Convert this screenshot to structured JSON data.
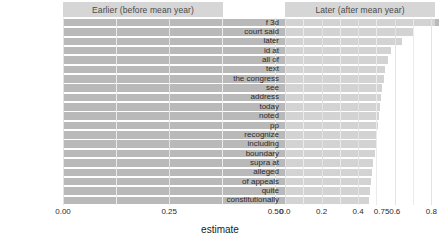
{
  "chart_data": {
    "type": "bar",
    "title": "",
    "xlabel": "estimate",
    "ylabel": "",
    "orientation": "horizontal",
    "grid": true,
    "legend": false,
    "facets": [
      {
        "strip_label": "Earlier (before mean year)",
        "xlim": [
          0.0,
          0.885
        ],
        "xticks": [
          0.0,
          0.25,
          0.5,
          0.75
        ],
        "xticklabels": [
          "0.00",
          "0.25",
          "0.50",
          "0.75"
        ],
        "categories": [
          "1st",
          "ought",
          "admit",
          "case of",
          "afterwards",
          "yet",
          "ch",
          "the said",
          "this cause",
          "section of",
          "laid",
          "occasion",
          "contended",
          "considered as",
          "the counsel",
          "on board",
          "the judges",
          "the defendant",
          "supposed",
          "thing"
        ],
        "values": [
          0.885,
          0.845,
          0.815,
          0.8,
          0.79,
          0.787,
          0.785,
          0.783,
          0.78,
          0.77,
          0.718,
          0.668,
          0.663,
          0.65,
          0.63,
          0.62,
          0.615,
          0.61,
          0.605,
          0.6
        ]
      },
      {
        "strip_label": "Later (after mean year)",
        "xlim": [
          0.0,
          0.82
        ],
        "xticks": [
          0.0,
          0.2,
          0.4,
          0.6,
          0.8
        ],
        "xticklabels": [
          "0.0",
          "0.2",
          "0.4",
          "0.6",
          "0.8"
        ],
        "categories": [
          "f 3d",
          "court said",
          "later",
          "id at",
          "all of",
          "text",
          "the congress",
          "see",
          "address",
          "today",
          "noted",
          "pp",
          "recognize",
          "including",
          "boundary",
          "supra at",
          "alleged",
          "of appeals",
          "quite",
          "constitutionally"
        ],
        "values": [
          0.82,
          0.7,
          0.64,
          0.58,
          0.565,
          0.545,
          0.54,
          0.53,
          0.525,
          0.52,
          0.515,
          0.51,
          0.5,
          0.498,
          0.49,
          0.482,
          0.478,
          0.47,
          0.462,
          0.46
        ]
      }
    ]
  },
  "colors": {
    "bar_earlier": "#b9b9b9",
    "bar_later": "#d3d3d3",
    "strip_background": "#d6d6d6",
    "grid": "#ebebeb",
    "panel_background": "#ffffff",
    "text": "#2b2b2b"
  }
}
